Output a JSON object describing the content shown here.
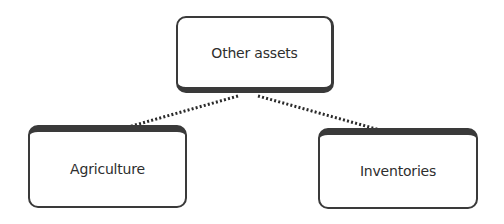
{
  "diagram": {
    "type": "hierarchy",
    "root": {
      "label": "Other assets"
    },
    "children": [
      {
        "label": "Agriculture"
      },
      {
        "label": "Inventories"
      }
    ],
    "connector_style": "dotted",
    "colors": {
      "border": "#3a3a3a",
      "text": "#2e2e2e",
      "connector": "#2a2a2a",
      "background": "#ffffff"
    }
  }
}
